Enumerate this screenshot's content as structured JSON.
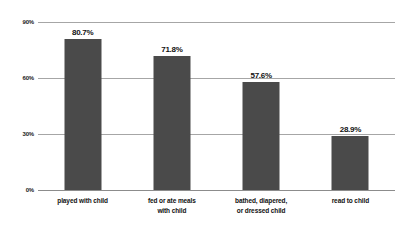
{
  "chart_data": {
    "type": "bar",
    "title": "",
    "subtitle": "",
    "xlabel": "",
    "ylabel": "",
    "categories": [
      "played with child",
      "fed or ate meals\nwith child",
      "bathed, diapered,\nor dressed child",
      "read to child"
    ],
    "values": [
      80.7,
      57.6,
      71.8,
      28.9
    ],
    "value_labels": [
      "80.7%",
      "71.8%",
      "57.6%",
      "28.9%"
    ],
    "ylim": [
      0,
      90
    ],
    "yticks": [
      0,
      30,
      60,
      90
    ],
    "ytick_labels": [
      "0%",
      "30%",
      "60%",
      "90%"
    ],
    "grid": true,
    "legend": "none",
    "series": [
      {
        "name": "",
        "values": [
          80.7,
          71.8,
          57.6,
          28.9
        ]
      }
    ],
    "colors": {
      "bar": "#4a4a4a",
      "gridline": "#a6a6a6",
      "baseline": "#8c8c8c",
      "text": "#111111",
      "background": "#ffffff"
    }
  },
  "bars": [
    {
      "label": "played with child",
      "label_line1": "played with child",
      "label_line2": "",
      "value": 80.7,
      "value_label": "80.7%"
    },
    {
      "label": "fed or ate meals with child",
      "label_line1": "fed or ate meals",
      "label_line2": "with child",
      "value": 71.8,
      "value_label": "71.8%"
    },
    {
      "label": "bathed, diapered, or dressed child",
      "label_line1": "bathed, diapered,",
      "label_line2": "or dressed child",
      "value": 57.6,
      "value_label": "57.6%"
    },
    {
      "label": "read to child",
      "label_line1": "read to child",
      "label_line2": "",
      "value": 28.9,
      "value_label": "28.9%"
    }
  ],
  "axis": {
    "yticks": [
      {
        "label": "90%",
        "value": 90
      },
      {
        "label": "60%",
        "value": 60
      },
      {
        "label": "30%",
        "value": 30
      },
      {
        "label": "0%",
        "value": 0
      }
    ]
  }
}
